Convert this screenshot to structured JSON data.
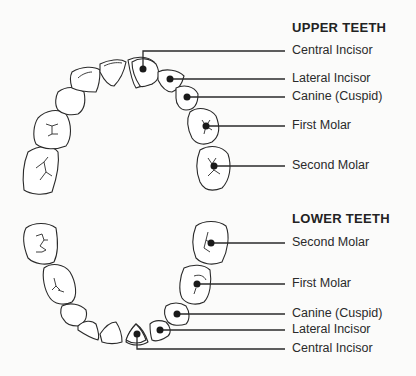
{
  "upper": {
    "title": "UPPER TEETH",
    "labels": [
      "Central Incisor",
      "Lateral Incisor",
      "Canine (Cuspid)",
      "First Molar",
      "Second Molar"
    ]
  },
  "lower": {
    "title": "LOWER TEETH",
    "labels": [
      "Second Molar",
      "First Molar",
      "Canine (Cuspid)",
      "Lateral Incisor",
      "Central Incisor"
    ]
  },
  "colors": {
    "stroke": "#2a2a2a",
    "background": "#fbfbfa",
    "fill": "#ffffff"
  }
}
